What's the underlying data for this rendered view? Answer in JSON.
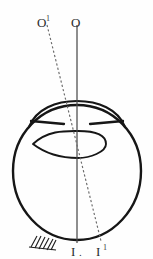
{
  "figure": {
    "name": "eye-optical-axis-diagram",
    "background_color": "#fefefe",
    "ink_color": "#1a1a1a",
    "labels": {
      "object_primary": "O",
      "object_secondary": "O",
      "object_secondary_superscript": "1",
      "image_primary": "I",
      "image_primary_period": ".",
      "image_secondary": "I",
      "image_secondary_superscript": "1"
    },
    "parts": {
      "globe": "eyeball-outline",
      "cornea": "cornea-arc",
      "iris_left": "iris-left-segment",
      "iris_right": "iris-right-segment",
      "lens": "crystalline-lens",
      "axis_solid": "optical-axis-solid",
      "axis_dashed": "visual-axis-dashed",
      "hatching": "muscle-insertion-hatching"
    },
    "geometry": {
      "globe_center_x": 77,
      "globe_center_y": 171,
      "globe_radius": 66,
      "axis_solid_x": 77,
      "axis_solid_top_y": 25,
      "axis_solid_bottom_y": 243,
      "axis_dashed_top_x": 47,
      "axis_dashed_top_y": 25,
      "axis_dashed_bottom_x": 101,
      "axis_dashed_bottom_y": 241
    }
  }
}
